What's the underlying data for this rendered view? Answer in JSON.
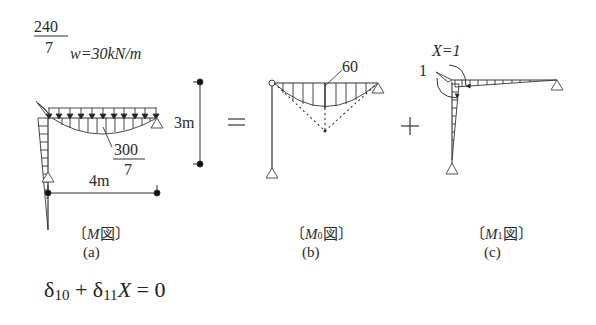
{
  "figure_a": {
    "top_moment_numerator": "240",
    "top_moment_denominator": "7",
    "load_label": "w=30kN/m",
    "mid_moment_numerator": "300",
    "mid_moment_denominator": "7",
    "span_label": "4m",
    "caption_symbol": "M",
    "caption_suffix": "図",
    "caption_open": "〔",
    "caption_close": "〕",
    "sub_label": "(a)"
  },
  "height_dim": {
    "label": "3m"
  },
  "operators": {
    "equals": "=",
    "plus": "+"
  },
  "figure_b": {
    "peak_label": "60",
    "caption_symbol": "M",
    "caption_index": "0",
    "caption_suffix": "図",
    "caption_open": "〔",
    "caption_close": "〕",
    "sub_label": "(b)"
  },
  "figure_c": {
    "unit_moment_label": "1",
    "load_label": "X=1",
    "caption_symbol": "M",
    "caption_index": "1",
    "caption_suffix": "図",
    "caption_open": "〔",
    "caption_close": "〕",
    "sub_label": "(c)"
  },
  "equation": {
    "delta": "δ",
    "index1": "10",
    "plus": "+",
    "index2": "11",
    "var": "X",
    "equals": "= 0"
  }
}
